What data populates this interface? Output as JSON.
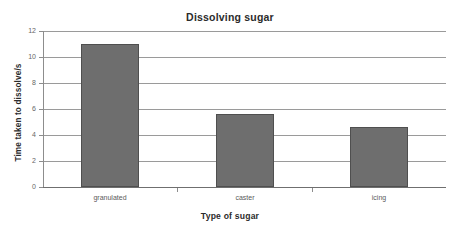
{
  "chart_data": {
    "type": "bar",
    "title": "Dissolving sugar",
    "xlabel": "Type of sugar",
    "ylabel": "Time taken to dissolve/s",
    "categories": [
      "granulated",
      "caster",
      "icing"
    ],
    "values": [
      11.0,
      5.6,
      4.6
    ],
    "ylim": [
      0,
      12
    ],
    "yticks": [
      0,
      2,
      4,
      6,
      8,
      10,
      12
    ],
    "ytick_labels": [
      "0",
      "2",
      "4",
      "6",
      "8",
      "10",
      "12"
    ],
    "grid": "horizontal",
    "legend": "none",
    "bar_color": "#6e6e6e",
    "bar_border_color": "#4f4f4f",
    "gridline_color": "#9a9a9a",
    "axis_color": "#8d8d8d",
    "background_color": "#ffffff",
    "series": [
      {
        "name": "Time taken to dissolve/s",
        "values": [
          11.0,
          5.6,
          4.6
        ]
      }
    ]
  }
}
